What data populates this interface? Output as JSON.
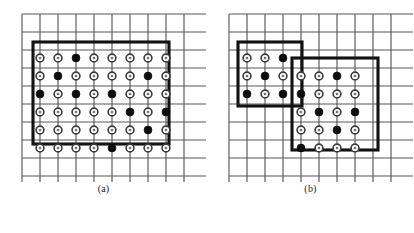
{
  "figure": {
    "panels": [
      {
        "id": "a",
        "caption": "(a)",
        "grid": {
          "columns": 10,
          "rows": 10,
          "x0": 22,
          "y0": 14,
          "spacing": 18,
          "extent_x": 184,
          "extent_y": 168
        },
        "regions": [
          {
            "name": "region-1",
            "x": 33,
            "y": 42,
            "width": 136,
            "height": 102
          }
        ],
        "dot_grid": {
          "cols": 8,
          "rows": 6,
          "x0": 40,
          "y0": 58,
          "spacing": 18
        },
        "filled_dots": [
          [
            1,
            3
          ],
          [
            2,
            2
          ],
          [
            2,
            7
          ],
          [
            3,
            1
          ],
          [
            3,
            3
          ],
          [
            3,
            5
          ],
          [
            4,
            6
          ],
          [
            4,
            8
          ],
          [
            5,
            7
          ],
          [
            6,
            5
          ]
        ]
      },
      {
        "id": "b",
        "caption": "(b)",
        "grid": {
          "columns": 10,
          "rows": 10,
          "x0": 22,
          "y0": 14,
          "spacing": 18,
          "extent_x": 184,
          "extent_y": 168
        },
        "regions": [
          {
            "name": "region-left",
            "x": 31,
            "y": 42,
            "width": 64,
            "height": 64
          },
          {
            "name": "region-right",
            "x": 85,
            "y": 58,
            "width": 86,
            "height": 92
          }
        ],
        "dot_grids": [
          {
            "name": "dots-left",
            "cols": 3,
            "rows": 3,
            "x0": 40,
            "y0": 58,
            "spacing": 18,
            "filled_dots": [
              [
                1,
                3
              ],
              [
                2,
                2
              ],
              [
                3,
                1
              ],
              [
                3,
                3
              ]
            ]
          },
          {
            "name": "dots-right",
            "cols": 4,
            "rows": 5,
            "x0": 94,
            "y0": 76,
            "spacing": 18,
            "filled_dots": [
              [
                1,
                3
              ],
              [
                2,
                1
              ],
              [
                3,
                2
              ],
              [
                3,
                4
              ],
              [
                4,
                3
              ],
              [
                5,
                1
              ]
            ]
          }
        ]
      }
    ]
  },
  "style": {
    "grid_line_color": "#58585a",
    "region_stroke_color": "#121212",
    "dot_filled_color": "#0d0d0d",
    "dot_open_fill": "#ffffff",
    "dot_open_stroke": "#3b3b3b",
    "background": "#ffffff"
  },
  "legend": {
    "open_dot_meaning": "open-node",
    "filled_dot_meaning": "filled-node"
  }
}
